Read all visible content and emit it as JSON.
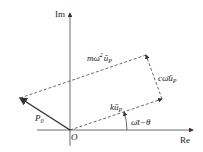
{
  "diagram": {
    "axes": {
      "imaginary_label": "Im",
      "real_label": "Re",
      "origin_label": "O"
    },
    "vectors": [
      {
        "name": "P0",
        "label": "P",
        "subscript": "0",
        "style": "solid"
      },
      {
        "name": "k_up",
        "label": "kū",
        "subscript": "P",
        "style": "dashed"
      },
      {
        "name": "c_omega_up",
        "label": "cω̄ū",
        "subscript": "P",
        "style": "dashed"
      },
      {
        "name": "m_omega2_up",
        "label": "mω̄",
        "superscript": "2",
        "label2": "ū",
        "subscript": "P",
        "style": "dashed"
      }
    ],
    "angle_label": "ω̄t−θ"
  }
}
